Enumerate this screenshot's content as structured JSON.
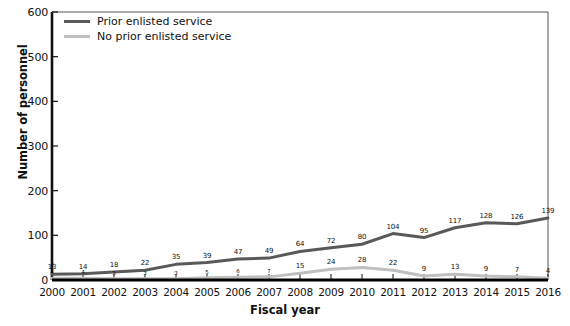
{
  "chart_data": {
    "type": "line",
    "title": "",
    "xlabel": "Fiscal year",
    "ylabel": "Number of personnel",
    "categories": [
      "2000",
      "2001",
      "2002",
      "2003",
      "2004",
      "2005",
      "2006",
      "2007",
      "2008",
      "2009",
      "2010",
      "2011",
      "2012",
      "2013",
      "2014",
      "2015",
      "2016"
    ],
    "ylim": [
      0,
      600
    ],
    "yticks": [
      0,
      100,
      200,
      300,
      400,
      500,
      600
    ],
    "grid": false,
    "legend_position": "top-left",
    "series": [
      {
        "name": "Prior enlisted service",
        "color": "#595959",
        "values": [
          13,
          14,
          18,
          22,
          35,
          39,
          47,
          49,
          64,
          72,
          80,
          104,
          95,
          117,
          128,
          126,
          139
        ],
        "labels": [
          "13",
          "14",
          "18",
          "22",
          "35",
          "39",
          "47",
          "49",
          "64",
          "72",
          "80",
          "104",
          "95",
          "117",
          "128",
          "126",
          "139"
        ]
      },
      {
        "name": "No prior enlisted service",
        "color": "#bfbfbf",
        "values": [
          4,
          4,
          3,
          3,
          3,
          5,
          6,
          7,
          15,
          24,
          28,
          22,
          9,
          13,
          9,
          7,
          4
        ],
        "labels": [
          "4",
          "4",
          "3",
          "3",
          "3",
          "5",
          "6",
          "7",
          "15",
          "24",
          "28",
          "22",
          "9",
          "13",
          "9",
          "7",
          "4"
        ]
      }
    ]
  },
  "axes": {
    "ylabel": "Number of personnel",
    "xlabel": "Fiscal year"
  }
}
